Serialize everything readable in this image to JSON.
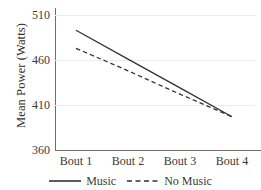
{
  "chart_data": {
    "type": "line",
    "title": "",
    "xlabel": "",
    "ylabel": "Mean Power (Watts)",
    "categories": [
      "Bout 1",
      "Bout 2",
      "Bout 3",
      "Bout 4"
    ],
    "yticks": [
      510,
      460,
      410,
      360
    ],
    "ylim": [
      360,
      510
    ],
    "grid": true,
    "legend_position": "bottom",
    "series": [
      {
        "name": "Music",
        "style": "solid",
        "color": "#333333",
        "values": [
          493,
          461,
          429,
          397
        ]
      },
      {
        "name": "No Music",
        "style": "dashed",
        "color": "#333333",
        "values": [
          473,
          448,
          422,
          397
        ]
      }
    ]
  },
  "axes": {
    "y_title": "Mean Power (Watts)",
    "y_tick_labels": [
      "510",
      "460",
      "410",
      "360"
    ],
    "x_tick_labels": [
      "Bout 1",
      "Bout 2",
      "Bout 3",
      "Bout 4"
    ]
  },
  "legend": {
    "items": [
      {
        "label": "Music",
        "style": "solid"
      },
      {
        "label": "No Music",
        "style": "dashed"
      }
    ]
  },
  "colors": {
    "series": "#333333",
    "axis": "#6f6f6f",
    "grid": "#ececec",
    "text": "#3a3a3a",
    "background": "#ffffff"
  }
}
